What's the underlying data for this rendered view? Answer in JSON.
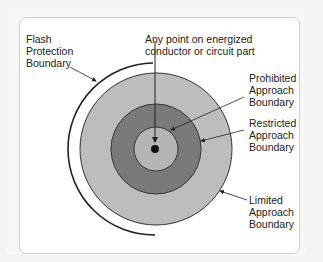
{
  "diagram": {
    "labels": {
      "flash": [
        "Flash",
        "Protection",
        "Boundary"
      ],
      "point": [
        "Any point on energized",
        "conductor or circuit part"
      ],
      "prohibited": [
        "Prohibited",
        "Approach",
        "Boundary"
      ],
      "restricted": [
        "Restricted",
        "Approach",
        "Boundary"
      ],
      "limited": [
        "Limited",
        "Approach",
        "Boundary"
      ]
    },
    "colors": {
      "limited_fill": "#bdbdbd",
      "restricted_fill": "#7a7a7a",
      "prohibited_fill": "#b5b5b5",
      "stroke": "#222222"
    }
  }
}
